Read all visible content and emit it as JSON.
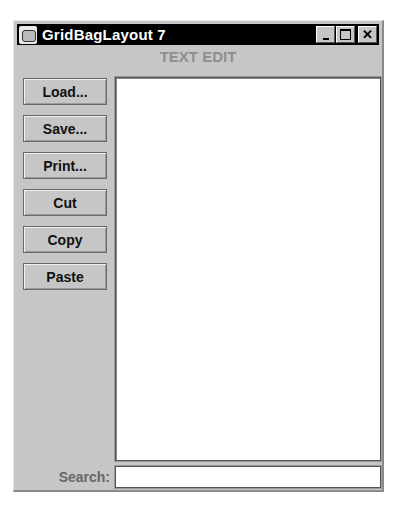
{
  "window": {
    "title": "GridBagLayout 7",
    "icon": "java-cup-icon",
    "controls": {
      "minimize_icon": "minimize-icon",
      "maximize_icon": "maximize-icon",
      "close_icon": "close-icon",
      "close_glyph": "✕"
    }
  },
  "header": {
    "label": "TEXT EDIT"
  },
  "buttons": [
    {
      "label": "Load..."
    },
    {
      "label": "Save..."
    },
    {
      "label": "Print..."
    },
    {
      "label": "Cut"
    },
    {
      "label": "Copy"
    },
    {
      "label": "Paste"
    }
  ],
  "editor": {
    "value": ""
  },
  "search": {
    "label": "Search:",
    "value": ""
  }
}
